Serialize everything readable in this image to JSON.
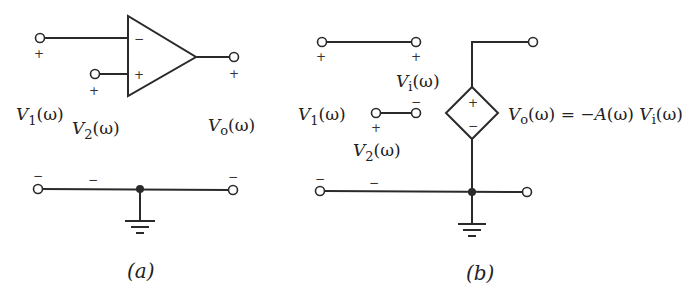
{
  "diagram": {
    "panel_a": {
      "caption": "(a)",
      "opamp": {
        "inverting_sign": "−",
        "noninverting_sign": "+"
      },
      "labels": {
        "v1_main": "V",
        "v1_sub": "1",
        "v1_arg": "(ω)",
        "v2_main": "V",
        "v2_sub": "2",
        "v2_arg": "(ω)",
        "vo_main": "V",
        "vo_sub": "o",
        "vo_arg": "(ω)"
      },
      "polarity": {
        "plus": "+",
        "minus": "−"
      }
    },
    "panel_b": {
      "caption": "(b)",
      "labels": {
        "v1_main": "V",
        "v1_sub": "1",
        "v1_arg": "(ω)",
        "v2_main": "V",
        "v2_sub": "2",
        "v2_arg": "(ω)",
        "vi_main": "V",
        "vi_sub": "i",
        "vi_arg": "(ω)"
      },
      "source_equation": {
        "lhs_main": "V",
        "lhs_sub": "o",
        "lhs_arg": "(ω)",
        "eq": " = −",
        "gain": "A",
        "gain_arg": "(ω) ",
        "rhs_main": "V",
        "rhs_sub": "i",
        "rhs_arg": "(ω)"
      },
      "source_signs": {
        "plus": "+",
        "minus": "−"
      },
      "polarity": {
        "plus": "+",
        "minus": "−"
      }
    }
  }
}
